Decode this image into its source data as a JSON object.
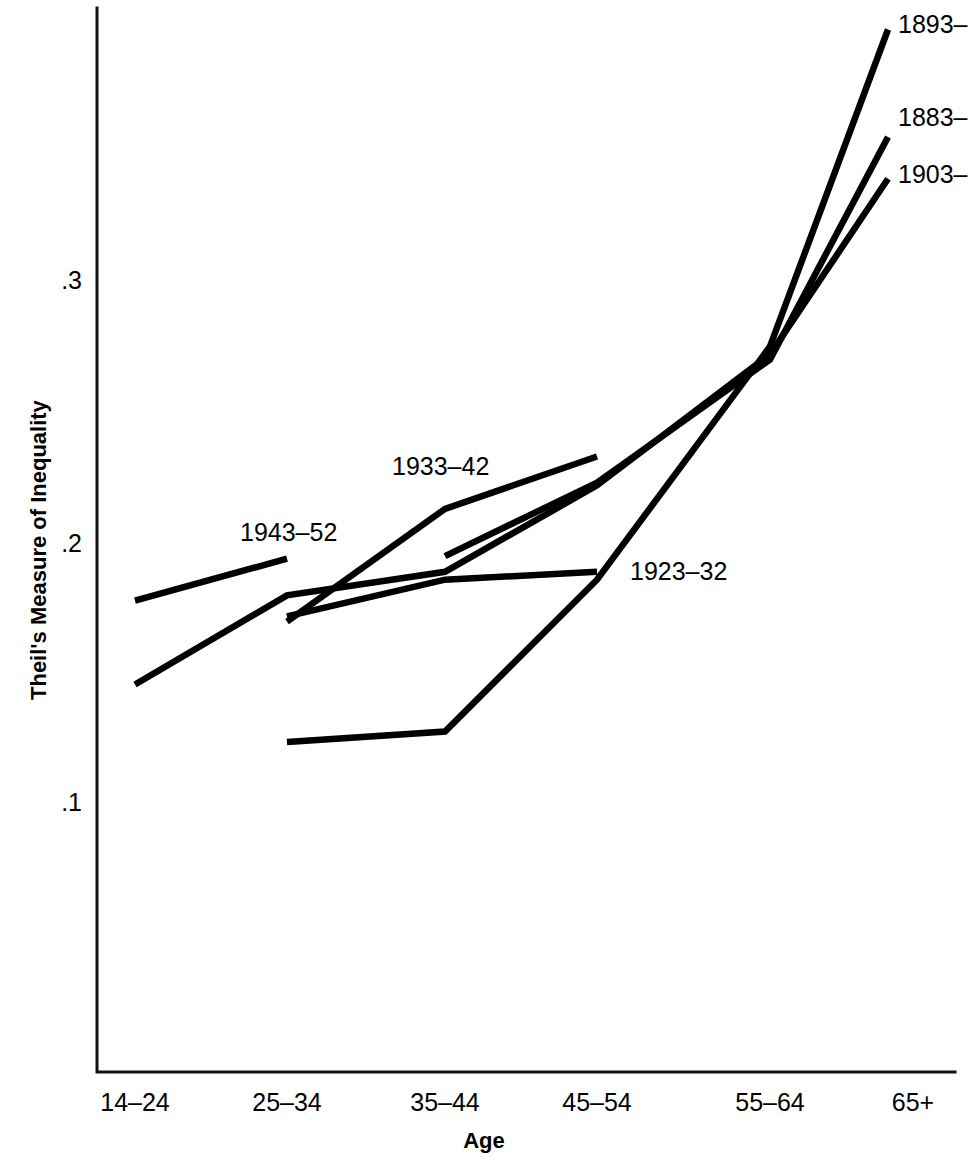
{
  "chart_data": {
    "type": "line",
    "title": "",
    "xlabel": "Age",
    "ylabel": "Theil's Measure of Inequality",
    "categories": [
      "14–24",
      "25–34",
      "35–44",
      "45–54",
      "55–64",
      "65+"
    ],
    "ytick_labels": [
      ".3",
      ".2",
      ".1"
    ],
    "ytick_values": [
      0.3,
      0.2,
      0.1
    ],
    "ylim": [
      0.085,
      0.4
    ],
    "grid": false,
    "legend_position": "inline-labels",
    "series": [
      {
        "name": "1883–",
        "label": "1883–",
        "x": [
          "35–44",
          "45–54",
          "55–64",
          "65+"
        ],
        "values": [
          0.195,
          0.223,
          0.27,
          0.355
        ]
      },
      {
        "name": "1893–",
        "label": "1893–",
        "x": [
          "25–34",
          "35–44",
          "45–54",
          "55–64",
          "65+"
        ],
        "values": [
          0.124,
          0.128,
          0.186,
          0.275,
          0.396
        ]
      },
      {
        "name": "1903–",
        "label": "1903–",
        "x": [
          "14–24",
          "25–34",
          "35–44",
          "45–54",
          "55–64",
          "65+"
        ],
        "values": [
          0.146,
          0.18,
          0.189,
          0.222,
          0.272,
          0.339
        ]
      },
      {
        "name": "1923–32",
        "label": "1923–32",
        "x": [
          "25–34",
          "35–44",
          "45–54"
        ],
        "values": [
          0.172,
          0.186,
          0.189
        ]
      },
      {
        "name": "1933–42",
        "label": "1933–42",
        "x": [
          "25–34",
          "35–44",
          "45–54"
        ],
        "values": [
          0.17,
          0.213,
          0.233
        ]
      },
      {
        "name": "1943–52",
        "label": "1943–52",
        "x": [
          "14–24",
          "25–34"
        ],
        "values": [
          0.178,
          0.194
        ]
      }
    ],
    "inline_labels": [
      {
        "text": "1893–",
        "anchor": "right-edge-top"
      },
      {
        "text": "1883–",
        "anchor": "right-edge-middle"
      },
      {
        "text": "1903–",
        "anchor": "right-edge-lower"
      },
      {
        "text": "1933–42",
        "anchor": "above-line-center-left"
      },
      {
        "text": "1943–52",
        "anchor": "above-line-left"
      },
      {
        "text": "1923–32",
        "anchor": "right-of-line-mid"
      }
    ],
    "colors": {
      "line": "#000000",
      "axis": "#111111",
      "background": "#ffffff"
    }
  }
}
